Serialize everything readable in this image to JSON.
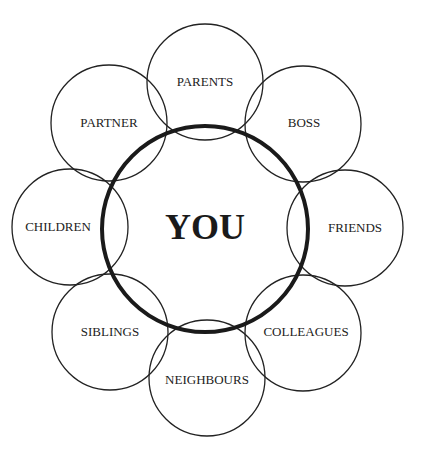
{
  "diagram": {
    "center": {
      "label": "YOU",
      "cx": 205,
      "cy": 229,
      "r": 103
    },
    "nodes": [
      {
        "label": "PARENTS",
        "cx": 205,
        "cy": 82,
        "r": 58
      },
      {
        "label": "BOSS",
        "cx": 303,
        "cy": 124,
        "r": 58
      },
      {
        "label": "FRIENDS",
        "cx": 345,
        "cy": 228,
        "r": 58
      },
      {
        "label": "COLLEAGUES",
        "cx": 303,
        "cy": 333,
        "r": 58
      },
      {
        "label": "NEIGHBOURS",
        "cx": 207,
        "cy": 378,
        "r": 58
      },
      {
        "label": "SIBLINGS",
        "cx": 110,
        "cy": 332,
        "r": 58
      },
      {
        "label": "CHILDREN",
        "cx": 70,
        "cy": 227,
        "r": 58
      },
      {
        "label": "PARTNER",
        "cx": 109,
        "cy": 123,
        "r": 58
      }
    ]
  }
}
